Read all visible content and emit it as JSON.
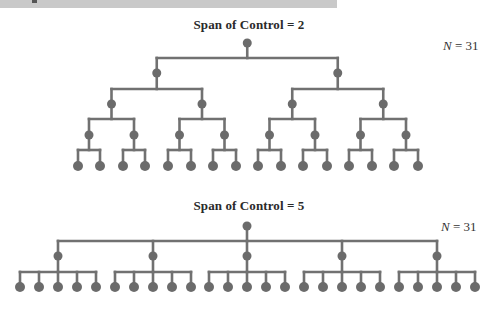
{
  "banner": {
    "color": "#c9c9c9"
  },
  "style": {
    "node_color": "#6b6b6b",
    "line_color": "#717171",
    "line_width": 2.6
  },
  "diagrams": [
    {
      "title": "Span of Control = 2",
      "span": 2,
      "n_var": "N",
      "n_rest": " = 31",
      "total_nodes": 31,
      "levels": 5,
      "title_top": 17,
      "n_label_pos": {
        "left": 443,
        "top": 38
      },
      "root": {
        "x": 247,
        "y": 43
      },
      "level_y": [
        43,
        73,
        104,
        135,
        166
      ],
      "bar_y": [
        58,
        89,
        119,
        150
      ],
      "leaf_y": 166,
      "leaf_x": [
        78,
        100,
        123,
        145,
        168,
        191,
        213,
        236,
        258,
        281,
        303,
        327,
        349,
        372,
        394,
        418
      ]
    },
    {
      "title": "Span of Control = 5",
      "span": 5,
      "n_var": "N",
      "n_rest": " = 31",
      "total_nodes": 31,
      "levels": 3,
      "title_top": 198,
      "n_label_pos": {
        "left": 441,
        "top": 219
      },
      "root": {
        "x": 247,
        "y": 226
      },
      "level_y": [
        226,
        256,
        287
      ],
      "bar_y": [
        241,
        272
      ],
      "leaf_y": 287,
      "leaf_x": [
        20,
        39,
        58,
        77,
        96,
        115,
        134,
        153,
        172,
        191,
        209,
        228,
        247,
        266,
        285,
        304,
        323,
        342,
        361,
        380,
        399,
        418,
        437,
        456,
        475
      ]
    }
  ]
}
